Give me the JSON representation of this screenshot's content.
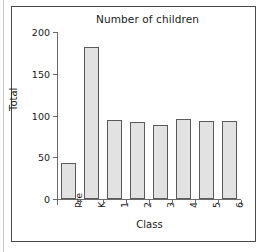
{
  "chart_data": {
    "type": "bar",
    "title": "Number of children",
    "xlabel": "Class",
    "ylabel": "Total",
    "categories": [
      "Pre",
      "K",
      "1",
      "2",
      "3",
      "4",
      "5",
      "6"
    ],
    "values": [
      43,
      182,
      95,
      92,
      89,
      96,
      94,
      93
    ],
    "ylim": [
      0,
      200
    ],
    "yticks": [
      0,
      50,
      100,
      150,
      200
    ],
    "ytick_labels": [
      "0",
      "50",
      "100",
      "150",
      "200"
    ],
    "grid": false,
    "legend": null,
    "bar_fill_color": "#e2e2e2",
    "bar_edge_color": "#5a5a5a",
    "axis_color": "#6b6b6b",
    "text_color": "#1a1a1a",
    "frame_color": "#4a4a4a",
    "background_color": "#ffffff"
  }
}
